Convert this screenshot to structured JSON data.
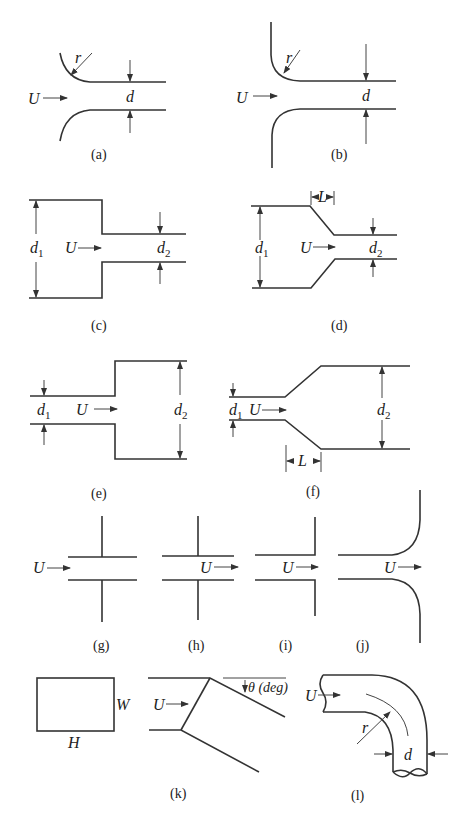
{
  "figure": {
    "panels": [
      {
        "id": "a",
        "caption": "(a)",
        "labels": {
          "flow": "U",
          "radius": "r",
          "diameter": "d"
        },
        "description": "Rounded entrance (flush)"
      },
      {
        "id": "b",
        "caption": "(b)",
        "labels": {
          "flow": "U",
          "radius": "r",
          "diameter": "d"
        },
        "description": "Rounded entrance with flange wall"
      },
      {
        "id": "c",
        "caption": "(c)",
        "labels": {
          "flow": "U",
          "d1": "d",
          "d1_sub": "1",
          "d2": "d",
          "d2_sub": "2"
        },
        "description": "Sudden contraction"
      },
      {
        "id": "d",
        "caption": "(d)",
        "labels": {
          "flow": "U",
          "length": "L",
          "d1": "d",
          "d1_sub": "1",
          "d2": "d",
          "d2_sub": "2"
        },
        "description": "Gradual contraction"
      },
      {
        "id": "e",
        "caption": "(e)",
        "labels": {
          "flow": "U",
          "d1": "d",
          "d1_sub": "1",
          "d2": "d",
          "d2_sub": "2"
        },
        "description": "Sudden expansion"
      },
      {
        "id": "f",
        "caption": "(f)",
        "labels": {
          "flow": "U",
          "length": "L",
          "d1": "d",
          "d1_sub": "1",
          "d2": "d",
          "d2_sub": "2"
        },
        "description": "Gradual expansion"
      },
      {
        "id": "g",
        "caption": "(g)",
        "labels": {
          "flow": "U"
        },
        "description": "Re-entrant inlet"
      },
      {
        "id": "h",
        "caption": "(h)",
        "labels": {
          "flow": "U"
        },
        "description": "Re-entrant exit"
      },
      {
        "id": "i",
        "caption": "(i)",
        "labels": {
          "flow": "U"
        },
        "description": "Sharp-edged exit"
      },
      {
        "id": "j",
        "caption": "(j)",
        "labels": {
          "flow": "U"
        },
        "description": "Rounded exit"
      },
      {
        "id": "k",
        "caption": "(k)",
        "labels": {
          "flow": "U",
          "width": "W",
          "height": "H",
          "angle": "θ (deg)"
        },
        "description": "Rectangular miter bend"
      },
      {
        "id": "l",
        "caption": "(l)",
        "labels": {
          "flow": "U",
          "radius": "r",
          "diameter": "d"
        },
        "description": "Smooth bend"
      }
    ]
  }
}
